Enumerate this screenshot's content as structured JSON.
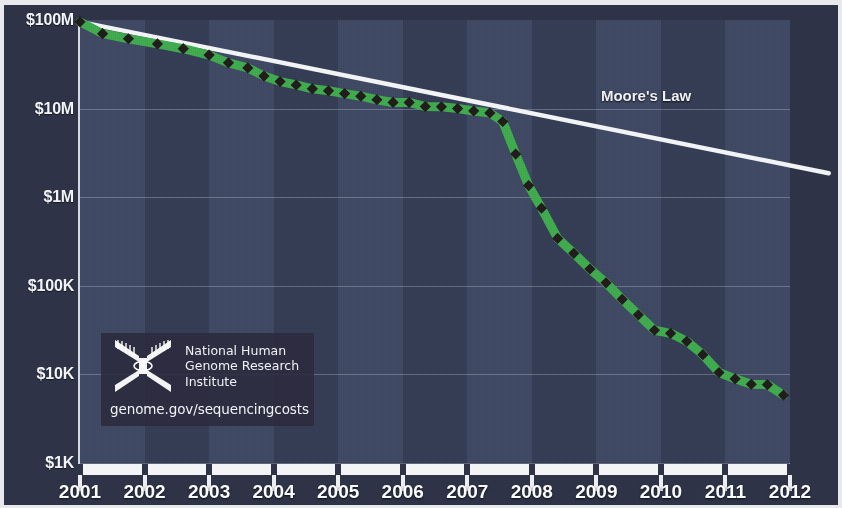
{
  "figure": {
    "moore_law_label": "Moore's Law",
    "accent_green": "#3faa4e",
    "marker_color": "#221c1c",
    "moore_line_color": "#f2f3f5",
    "plot_bg": "#39415a",
    "panel_bg": "#2e3347",
    "band_light": "#4a5874",
    "band_dark": "#333b52"
  },
  "logo": {
    "line1": "National Human",
    "line2": "Genome Research",
    "line3": "Institute",
    "url": "genome.gov/sequencingcosts",
    "mark_name": "dna-helix-mark"
  },
  "chart_data": {
    "type": "line",
    "title": "",
    "subtitle": "",
    "xlabel": "",
    "ylabel": "",
    "yscale": "log",
    "ylim": [
      1000,
      100000000
    ],
    "xlim": [
      2001,
      2012
    ],
    "grid": true,
    "legend_position": "inline-annotation",
    "ytick_labels": [
      "$100M",
      "$10M",
      "$1M",
      "$100K",
      "$10K",
      "$1K"
    ],
    "ytick_values": [
      100000000,
      10000000,
      1000000,
      100000,
      10000,
      1000
    ],
    "xtick_labels": [
      "2001",
      "2002",
      "2003",
      "2004",
      "2005",
      "2006",
      "2007",
      "2008",
      "2009",
      "2010",
      "2011",
      "2012"
    ],
    "xtick_values": [
      2001,
      2002,
      2003,
      2004,
      2005,
      2006,
      2007,
      2008,
      2009,
      2010,
      2011,
      2012
    ],
    "series": [
      {
        "name": "Cost per Genome",
        "color": "#3faa4e",
        "marker": "diamond",
        "x": [
          2001.0,
          2001.35,
          2001.75,
          2002.2,
          2002.6,
          2003.0,
          2003.3,
          2003.6,
          2003.85,
          2004.1,
          2004.35,
          2004.6,
          2004.85,
          2005.1,
          2005.35,
          2005.6,
          2005.85,
          2006.1,
          2006.35,
          2006.6,
          2006.85,
          2007.1,
          2007.35,
          2007.55,
          2007.75,
          2007.95,
          2008.15,
          2008.4,
          2008.65,
          2008.9,
          2009.15,
          2009.4,
          2009.65,
          2009.9,
          2010.15,
          2010.4,
          2010.65,
          2010.9,
          2011.15,
          2011.4,
          2011.65,
          2011.9
        ],
        "y": [
          95263072,
          70175437,
          61448422,
          53751684,
          47411108,
          40157554,
          32852043,
          28780376,
          23278334,
          20181727,
          18519312,
          16712371,
          15880264,
          14773043,
          13801124,
          12585762,
          11732535,
          11732535,
          10540000,
          10474556,
          10014286,
          9408739,
          8927342,
          7147571,
          3063820,
          1352982,
          752080,
          342502,
          232735,
          154714,
          108065,
          70333,
          47079,
          31512,
          29092,
          23642,
          16712,
          10497,
          8907,
          7743,
          7666,
          5826
        ]
      },
      {
        "name": "Moore's Law",
        "color": "#f2f3f5",
        "marker": "none",
        "x": [
          2001.0,
          2012.6
        ],
        "y": [
          95263072,
          1860000
        ]
      }
    ],
    "annotations": [
      {
        "text": "Moore's Law",
        "x": 2010.0,
        "y": 14000000
      }
    ]
  }
}
